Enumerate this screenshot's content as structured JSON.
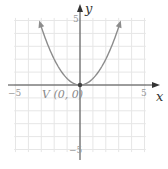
{
  "chart_data": {
    "type": "line",
    "title": "",
    "xlabel": "x",
    "ylabel": "y",
    "xlim": [
      -5,
      5
    ],
    "ylim": [
      -5,
      5
    ],
    "grid": true,
    "x_tick_labels": [
      "-5",
      "5"
    ],
    "y_tick_labels": [
      "5",
      "-5"
    ],
    "series": [
      {
        "name": "y = x^2 / 2",
        "x": [
          -3.16,
          -3,
          -2.5,
          -2,
          -1.5,
          -1,
          -0.5,
          0,
          0.5,
          1,
          1.5,
          2,
          2.5,
          3,
          3.16
        ],
        "y": [
          5,
          4.5,
          3.125,
          2,
          1.125,
          0.5,
          0.125,
          0,
          0.125,
          0.5,
          1.125,
          2,
          3.125,
          4.5,
          5
        ]
      }
    ],
    "annotations": [
      {
        "text": "V (0, 0)",
        "x": 0,
        "y": 0
      }
    ]
  },
  "labels": {
    "x_axis": "x",
    "y_axis": "y",
    "x_min": "−5",
    "x_max": "5",
    "y_max": "5",
    "y_min": "−5",
    "vertex": "V (0, 0)"
  },
  "colors": {
    "grid": "#e6e6e6",
    "axis": "#444444",
    "curve": "#8c8c8c",
    "vertex_dot": "#444444"
  }
}
